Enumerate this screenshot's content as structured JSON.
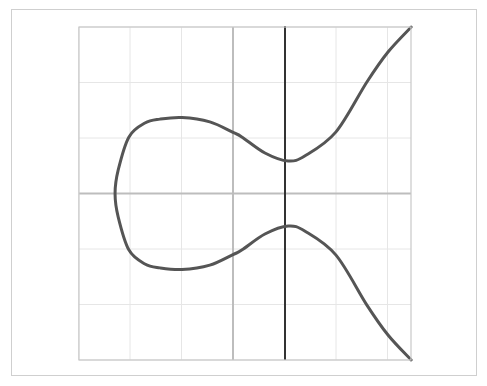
{
  "chart_data": {
    "type": "line",
    "title": "",
    "xlabel": "",
    "ylabel": "",
    "equation_hint": "elliptic curve y^2 = x^3 + ax + b (one real component with loop)",
    "grid": true,
    "legend": null,
    "xlim": [
      -3,
      3.45
    ],
    "ylim": [
      -3,
      3
    ],
    "x_gridlines": [
      -3,
      -2,
      -1,
      0,
      1,
      2,
      3
    ],
    "y_gridlines": [
      -3,
      -2,
      -1,
      0,
      1,
      2,
      3
    ],
    "x_axis_at_y": 0,
    "y_axis_gray_at_x": 0,
    "vertical_dark_line_at_x": 1,
    "series": [
      {
        "name": "curve",
        "symmetric_about_x_axis": true,
        "upper_half_points": [
          [
            -2.29,
            0.0
          ],
          [
            -2.23,
            0.42
          ],
          [
            -2.02,
            1.02
          ],
          [
            -1.71,
            1.27
          ],
          [
            -1.42,
            1.34
          ],
          [
            -0.99,
            1.37
          ],
          [
            -0.45,
            1.29
          ],
          [
            0.0,
            1.1
          ],
          [
            0.17,
            1.02
          ],
          [
            0.62,
            0.73
          ],
          [
            1.07,
            0.585
          ],
          [
            1.4,
            0.68
          ],
          [
            2.0,
            1.11
          ],
          [
            2.6,
            2.01
          ],
          [
            3.01,
            2.55
          ],
          [
            3.46,
            3.0
          ]
        ]
      }
    ]
  },
  "layout": {
    "plot_box": {
      "left": 79,
      "top": 27,
      "right": 411,
      "bottom": 360
    },
    "origin_px": {
      "x": 233,
      "y": 193.5
    },
    "unit_px": {
      "x": 51.5,
      "y": 55.5
    }
  },
  "colors": {
    "curve": "#555555",
    "dark_line": "#333333",
    "axis": "#bdbdbd",
    "grid": "#e6e6e6",
    "frame": "#cfcfcf",
    "plot_border": "#c8c8c8"
  }
}
